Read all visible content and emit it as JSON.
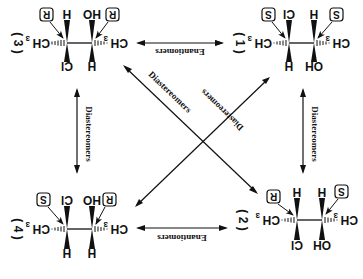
{
  "diagram": {
    "orientation": "rotated 180 degrees",
    "molecules": [
      {
        "id": "1",
        "label": "( 1 )",
        "config_left": "S",
        "config_right": "S",
        "left_carbon": {
          "top": "Cl",
          "bottom": "H",
          "side": "CH3"
        },
        "right_carbon": {
          "top": "H",
          "bottom": "OH",
          "side": "CH3"
        }
      },
      {
        "id": "2",
        "label": "( 2 )",
        "config_left": "R",
        "config_right": "S",
        "left_carbon": {
          "top": "H",
          "bottom": "Cl",
          "side": "CH3"
        },
        "right_carbon": {
          "top": "H",
          "bottom": "OH",
          "side": "CH3"
        }
      },
      {
        "id": "3",
        "label": "( 3 )",
        "config_left": "R",
        "config_right": "R",
        "left_carbon": {
          "top": "H",
          "bottom": "Cl",
          "side": "CH3"
        },
        "right_carbon": {
          "top": "HO",
          "bottom": "H",
          "side": "CH3"
        }
      },
      {
        "id": "4",
        "label": "( 4 )",
        "config_left": "S",
        "config_right": "R",
        "left_carbon": {
          "top": "Cl",
          "bottom": "H",
          "side": "CH3"
        },
        "right_carbon": {
          "top": "HO",
          "bottom": "H",
          "side": "CH3"
        }
      }
    ],
    "relations": [
      {
        "between": [
          "1",
          "3"
        ],
        "label": "Enantiomers"
      },
      {
        "between": [
          "2",
          "4"
        ],
        "label": "Enantiomers"
      },
      {
        "between": [
          "3",
          "4"
        ],
        "label": "Diastereomers"
      },
      {
        "between": [
          "1",
          "2"
        ],
        "label": "Diastereomers"
      },
      {
        "between": [
          "3",
          "2"
        ],
        "label": "Diastereomers"
      },
      {
        "between": [
          "1",
          "4"
        ],
        "label": "Diastereomers"
      }
    ],
    "atoms": {
      "ch": "CH",
      "three": "3",
      "h": "H",
      "cl": "Cl",
      "oh": "OH",
      "ho": "HO"
    },
    "labels": {
      "m1": "( 1 )",
      "m2": "( 2 )",
      "m3": "( 3 )",
      "m4": "( 4 )",
      "enant_top": "Enantiomers",
      "enant_bottom": "Enantiomers",
      "dia_left": "Diastereomers",
      "dia_right": "Diastereomers",
      "dia_diag1": "Diastereomers",
      "dia_diag2": "Diastereomers",
      "cfg_m3_left": "R",
      "cfg_m3_right": "R",
      "cfg_m1_left": "S",
      "cfg_m1_right": "S",
      "cfg_m4_left": "S",
      "cfg_m4_right": "R",
      "cfg_m2_left": "R",
      "cfg_m2_right": "S"
    }
  }
}
